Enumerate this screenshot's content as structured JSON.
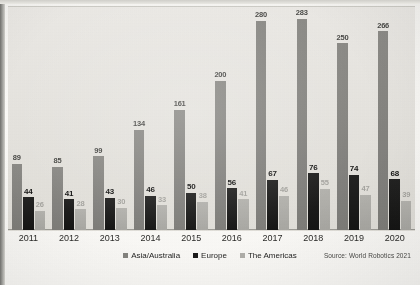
{
  "chart_data": {
    "type": "bar",
    "title": "",
    "xlabel": "",
    "ylabel": "",
    "ylim": [
      0,
      300
    ],
    "grid": false,
    "legend_position": "bottom-center",
    "categories": [
      "2011",
      "2012",
      "2013",
      "2014",
      "2015",
      "2016",
      "2017",
      "2018",
      "2019",
      "2020"
    ],
    "series": [
      {
        "name": "Asia/Australia",
        "color": "#85847f",
        "values": [
          89,
          85,
          99,
          134,
          161,
          200,
          280,
          283,
          250,
          266
        ]
      },
      {
        "name": "Europe",
        "color": "#1b1b1a",
        "values": [
          44,
          41,
          43,
          46,
          50,
          56,
          67,
          76,
          74,
          68
        ]
      },
      {
        "name": "The Americas",
        "color": "#b0afaa",
        "values": [
          26,
          28,
          30,
          33,
          38,
          41,
          46,
          55,
          47,
          39
        ]
      }
    ],
    "source_note": "Source: World Robotics 2021"
  },
  "legend": {
    "items": [
      {
        "label": "Asia/Australia",
        "color": "#85847f"
      },
      {
        "label": "Europe",
        "color": "#1b1b1a"
      },
      {
        "label": "The Americas",
        "color": "#b0afaa"
      }
    ]
  },
  "footer": {
    "source": "Source: World Robotics 2021"
  }
}
